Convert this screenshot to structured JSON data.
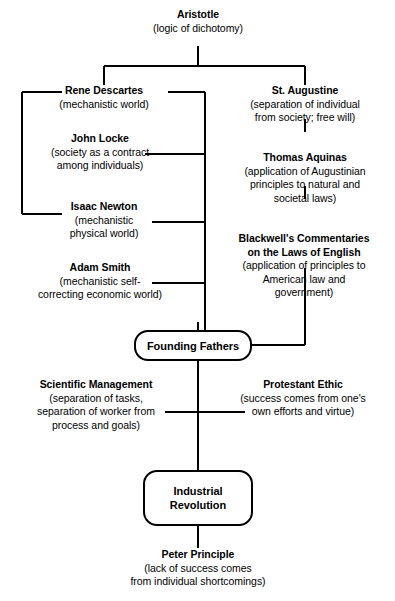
{
  "diagram": {
    "type": "flowchart",
    "line_color": "#000000",
    "background_color": "#ffffff",
    "text_color": "#000000"
  },
  "nodes": {
    "aristotle": {
      "title": "Aristotle",
      "desc": "(logic of dichotomy)"
    },
    "descartes": {
      "title": "Rene Descartes",
      "desc": "(mechanistic world)"
    },
    "locke": {
      "title": "John Locke",
      "desc_line1": "(society as a contract",
      "desc_line2": "among individuals)"
    },
    "newton": {
      "title": "Isaac Newton",
      "desc_line1": "(mechanistic",
      "desc_line2": "physical world)"
    },
    "smith": {
      "title": "Adam Smith",
      "desc_line1": "(mechanistic self-",
      "desc_line2": "correcting economic world)"
    },
    "augustine": {
      "title": "St. Augustine",
      "desc_line1": "(separation of individual",
      "desc_line2": "from society; free will)"
    },
    "aquinas": {
      "title": "Thomas Aquinas",
      "desc_line1": "(application of Augustinian",
      "desc_line2": "principles to natural and",
      "desc_line3": "societal laws)"
    },
    "blackwell": {
      "title_line1": "Blackwell's Commentaries",
      "title_line2": "on the Laws of English",
      "desc_line1": "(application of principles to",
      "desc_line2": "American law and",
      "desc_line3": "government)"
    },
    "founding_fathers": {
      "label": "Founding Fathers"
    },
    "scientific_management": {
      "title": "Scientific Management",
      "desc_line1": "(separation of tasks,",
      "desc_line2": "separation of worker from",
      "desc_line3": "process and goals)"
    },
    "protestant_ethic": {
      "title": "Protestant Ethic",
      "desc_line1": "(success comes from one's",
      "desc_line2": "own efforts and virtue)"
    },
    "industrial_revolution": {
      "label_line1": "Industrial",
      "label_line2": "Revolution"
    },
    "peter_principle": {
      "title": "Peter Principle",
      "desc_line1": "(lack of success comes",
      "desc_line2": "from individual shortcomings)"
    }
  }
}
